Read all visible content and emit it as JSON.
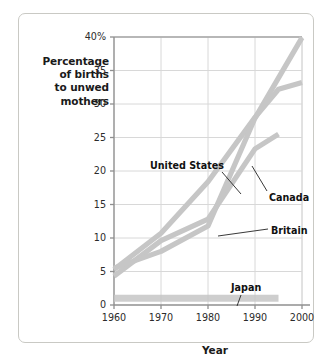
{
  "chart_data": {
    "type": "line",
    "title": "",
    "xlabel": "Year",
    "ylabel": "Percentage of births to unwed mothers",
    "ylabel_lines": [
      "Percentage",
      "of births",
      "to unwed",
      "mothers"
    ],
    "x": [
      1960,
      1970,
      1980,
      1990,
      2000
    ],
    "xlim": [
      1960,
      2000
    ],
    "ylim": [
      0,
      40
    ],
    "xticks": [
      "1960",
      "1970",
      "1980",
      "1990",
      "2000"
    ],
    "yticks": [
      "0",
      "5",
      "10",
      "15",
      "20",
      "25",
      "30",
      "35",
      "40%"
    ],
    "ytick_values": [
      0,
      5,
      10,
      15,
      20,
      25,
      30,
      35,
      40
    ],
    "grid": true,
    "legend_position": "inline-annotations",
    "line_color": "#c6c6c6",
    "grid_color": "#d8d8d8",
    "axis_color": "#8f8f8f",
    "series": [
      {
        "name": "United States",
        "x": [
          1960,
          1970,
          1980,
          1990,
          1995,
          2000
        ],
        "values": [
          5.3,
          10.7,
          18.4,
          28.0,
          32.2,
          33.2
        ],
        "label": "United States",
        "label_x": 131,
        "label_y": 146,
        "leader": [
          [
            203,
            158
          ],
          [
            222,
            180
          ]
        ]
      },
      {
        "name": "Canada",
        "x": [
          1960,
          1970,
          1980,
          1990,
          1995
        ],
        "values": [
          4.3,
          9.6,
          12.8,
          23.3,
          25.5
        ],
        "label": "Canada",
        "label_x": 250,
        "label_y": 178,
        "leader": [
          [
            248,
            177
          ],
          [
            233,
            152
          ]
        ]
      },
      {
        "name": "Britain",
        "x": [
          1960,
          1970,
          1980,
          1990,
          2000
        ],
        "values": [
          5.5,
          8.0,
          11.8,
          27.9,
          39.9
        ],
        "label": "Britain",
        "label_x": 252,
        "label_y": 211,
        "leader": [
          [
            249,
            215
          ],
          [
            199,
            222
          ]
        ]
      },
      {
        "name": "Japan",
        "x": [
          1960,
          1970,
          1980,
          1990,
          1995
        ],
        "values": [
          1.0,
          1.0,
          1.0,
          1.0,
          1.0
        ],
        "label": "Japan",
        "label_x": 212,
        "label_y": 268,
        "leader": [
          [
            222,
            281
          ],
          [
            218,
            292
          ]
        ]
      }
    ]
  }
}
